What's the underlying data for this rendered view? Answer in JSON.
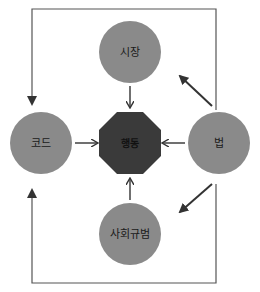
{
  "diagram": {
    "center": {
      "label": "행동",
      "shape": "octagon",
      "color": "#3a3a3a"
    },
    "nodes": [
      {
        "id": "market",
        "label": "시장",
        "position": "top",
        "color": "#8a8a8a"
      },
      {
        "id": "code",
        "label": "코드",
        "position": "left",
        "color": "#8a8a8a"
      },
      {
        "id": "law",
        "label": "법",
        "position": "right",
        "color": "#8a8a8a"
      },
      {
        "id": "norms",
        "label": "사회규범",
        "position": "bottom",
        "color": "#8a8a8a"
      }
    ],
    "edges": [
      {
        "from": "시장",
        "to": "행동"
      },
      {
        "from": "코드",
        "to": "행동"
      },
      {
        "from": "법",
        "to": "행동"
      },
      {
        "from": "사회규범",
        "to": "행동"
      },
      {
        "from": "법",
        "to": "시장"
      },
      {
        "from": "법",
        "to": "사회규범"
      },
      {
        "from": "법",
        "to": "코드",
        "route": "top"
      },
      {
        "from": "법",
        "to": "코드",
        "route": "bottom"
      }
    ]
  }
}
